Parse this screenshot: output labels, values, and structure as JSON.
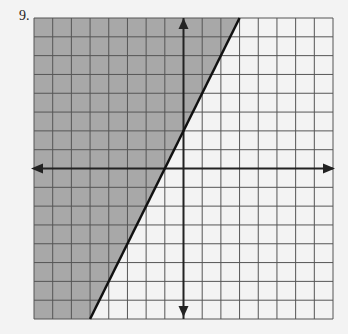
{
  "problem_number": "9.",
  "chart_data": {
    "type": "line",
    "title": "",
    "grid": {
      "x_range": [
        -8,
        8
      ],
      "y_range": [
        -8,
        8
      ],
      "step": 1,
      "grid_on": true
    },
    "boundary_line": {
      "slope": 2,
      "intercept": 2,
      "style": "solid",
      "points": [
        [
          -5,
          -8
        ],
        [
          3,
          8
        ]
      ]
    },
    "shaded_region": "left/above the line (y >= 2x + 2)",
    "colors": {
      "shade": "#a8a8a8",
      "grid": "#555555",
      "background": "#f3f3f3",
      "line": "#111111"
    },
    "xlabel": "",
    "ylabel": ""
  }
}
